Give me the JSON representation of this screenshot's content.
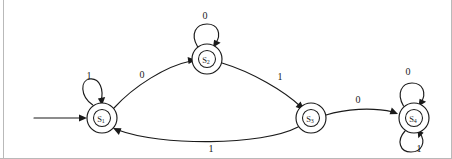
{
  "diagram": {
    "type": "finite-state-machine",
    "background_color": "#ffffff",
    "stroke_color": "#1a1a1a",
    "frame_color": "#b9b9b9",
    "alphabet": [
      "0",
      "1"
    ],
    "start_state": "S1",
    "states": [
      {
        "id": "S1",
        "label": "S",
        "subscript": "1",
        "cx": 102,
        "cy": 118,
        "r_outer": 15,
        "r_inner": 8.5,
        "double_circle": true,
        "is_start": true
      },
      {
        "id": "S2",
        "label": "S",
        "subscript": "2",
        "cx": 207,
        "cy": 59,
        "r_outer": 15,
        "r_inner": 8.5,
        "double_circle": true,
        "is_start": false
      },
      {
        "id": "S3",
        "label": "S",
        "subscript": "3",
        "cx": 311,
        "cy": 118,
        "r_outer": 15,
        "r_inner": 8.5,
        "double_circle": true,
        "is_start": false
      },
      {
        "id": "S4",
        "label": "S",
        "subscript": "4",
        "cx": 414,
        "cy": 118,
        "r_outer": 15,
        "r_inner": 8.5,
        "double_circle": true,
        "is_start": false
      }
    ],
    "transitions": [
      {
        "id": "t-s1-s1",
        "from": "S1",
        "to": "S1",
        "input": "1",
        "kind": "self-loop",
        "label_x": 89,
        "label_y": 75
      },
      {
        "id": "t-s1-s2",
        "from": "S1",
        "to": "S2",
        "input": "0",
        "kind": "curve",
        "label_x": 142,
        "label_y": 74
      },
      {
        "id": "t-s2-s2",
        "from": "S2",
        "to": "S2",
        "input": "0",
        "kind": "self-loop",
        "label_x": 205,
        "label_y": 15
      },
      {
        "id": "t-s2-s3",
        "from": "S2",
        "to": "S3",
        "input": "1",
        "kind": "curve",
        "label_x": 280,
        "label_y": 76
      },
      {
        "id": "t-s3-s1",
        "from": "S3",
        "to": "S1",
        "input": "1",
        "kind": "curve",
        "label_x": 211,
        "label_y": 148
      },
      {
        "id": "t-s3-s4",
        "from": "S3",
        "to": "S4",
        "input": "0",
        "kind": "curve",
        "label_x": 358,
        "label_y": 99
      },
      {
        "id": "t-s4-s4-top",
        "from": "S4",
        "to": "S4",
        "input": "0",
        "kind": "self-loop",
        "label_x": 408,
        "label_y": 71
      },
      {
        "id": "t-s4-s4-bottom",
        "from": "S4",
        "to": "S4",
        "input": "1",
        "kind": "self-loop",
        "label_x": 419,
        "label_y": 148
      }
    ],
    "start_arrow": {
      "x1": 34,
      "y1": 118,
      "x2": 85,
      "y2": 118
    }
  }
}
